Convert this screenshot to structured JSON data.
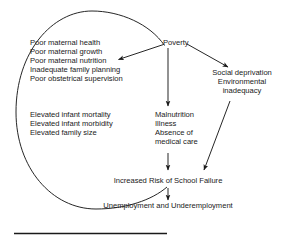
{
  "diagram": {
    "type": "cycle-flow-diagram",
    "root": {
      "label": "Poverty"
    },
    "branches": {
      "maternal_factors": {
        "name": "maternal-factors-list",
        "items": [
          "Poor maternal health",
          "Poor maternal growth",
          "Poor maternal nutrition",
          "Inadequate family planning",
          "Poor obstetrical supervision"
        ]
      },
      "infant_outcomes": {
        "name": "infant-outcomes-list",
        "items": [
          "Elevated infant mortality",
          "Elevated infant morbidity",
          "Elevated family size"
        ]
      },
      "health_factors": {
        "name": "health-factors-list",
        "items": [
          "Malnutrition",
          "Illness",
          "Absence of",
          "medical care"
        ]
      },
      "social_factors": {
        "name": "social-factors-list",
        "items": [
          "Social deprivation",
          "Environmental",
          "inadequacy"
        ]
      }
    },
    "outcomes": {
      "school_failure": "Increased Risk of School Failure",
      "employment": "Unemployment and Underemployment"
    },
    "colors": {
      "stroke": "#1a1a1a",
      "text": "#1a1a1a",
      "background": "#ffffff"
    }
  }
}
